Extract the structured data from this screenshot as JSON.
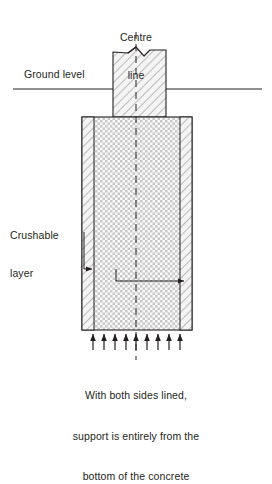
{
  "figure": {
    "labels": {
      "centre_line": "Centre\nline",
      "centre_line_l1": "Centre",
      "centre_line_l2": "line",
      "ground_level": "Ground level",
      "crushable_layer_l1": "Crushable",
      "crushable_layer_l2": "layer"
    },
    "caption": {
      "line1": "With both sides lined,",
      "line2": "support is entirely from the",
      "line3": "bottom of the concrete"
    },
    "colors": {
      "line": "#231f20",
      "hatch": "#8c8c8c",
      "fill_light": "#f2f2f2",
      "background": "#ffffff"
    },
    "geometry": {
      "centre_x": 136,
      "ground_level_y": 89,
      "ground_line_x1": 13,
      "ground_line_x2": 262,
      "pier_left": 113,
      "pier_right": 166,
      "pier_top": 47,
      "block_left": 82,
      "block_right": 192,
      "block_top": 117,
      "block_bottom": 330,
      "lining_left_width": 12,
      "lining_right_width": 12,
      "support_arrow_count": 9,
      "support_arrow_first_x": 93,
      "support_arrow_last_x": 180,
      "support_arrow_base_y": 350,
      "support_arrow_tip_y": 333
    },
    "elements": {
      "pier_name": "above-ground-pier",
      "block_name": "buried-concrete-block",
      "lining_name": "crushable-lining-strip",
      "break_symbol": "break-line-symbol",
      "support_arrows": "upward-support-arrows"
    }
  }
}
